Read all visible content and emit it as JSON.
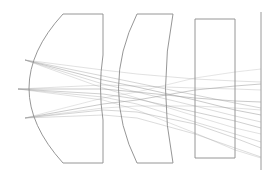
{
  "diagram": {
    "type": "optical-lens-ray-trace",
    "background": "#ffffff",
    "stroke_color": "#8a8a8a",
    "ray_color": "#9c9c9c",
    "elements": [
      {
        "name": "lens-1",
        "kind": "plano-convex",
        "path": "M63,14 L103,14 L103,55 Q98,88 103,120 L103,163 L63,163 Q-5,88 63,14 Z"
      },
      {
        "name": "lens-2",
        "kind": "meniscus",
        "path": "M137,14 L173,14 Q158,88 173,163 L137,163 Q100,88 137,14 Z"
      },
      {
        "name": "lens-3",
        "kind": "plate",
        "path": "M195,19 L235,19 L235,158 L195,158 Z"
      },
      {
        "name": "image-plane",
        "kind": "plane",
        "path": "M261,12 L261,170"
      }
    ],
    "rays": [
      {
        "d": "M25,60 L103,80 L137,87 L195,100 L235,110 L261,115",
        "opacity": 0.9
      },
      {
        "d": "M25,60 L103,76 L137,83 L195,95 L235,103 L261,108",
        "opacity": 0.7
      },
      {
        "d": "M25,60 L103,84 L137,92 L195,106 L235,116 L261,122",
        "opacity": 0.6
      },
      {
        "d": "M25,60 L103,70 L137,74 L195,79 L235,81 L261,82",
        "opacity": 0.5
      },
      {
        "d": "M25,60 L103,88 L137,98 L195,116 L235,128 L261,134",
        "opacity": 0.5
      },
      {
        "d": "M18,89 L103,89 L137,92 L195,98 L235,101 L261,102",
        "opacity": 0.9
      },
      {
        "d": "M18,89 L103,94 L137,99 L195,112 L235,121 L261,128",
        "opacity": 0.8
      },
      {
        "d": "M18,89 L103,97 L137,104 L195,122 L235,134 L261,142",
        "opacity": 0.6
      },
      {
        "d": "M18,89 L103,85 L137,86 L195,88 L235,89 L261,90",
        "opacity": 0.5
      },
      {
        "d": "M18,89 L103,100 L137,110 L195,133 L235,150 L261,158",
        "opacity": 0.5
      },
      {
        "d": "M25,118 L103,104 L137,100 L195,90 L235,86 L261,84",
        "opacity": 0.9
      },
      {
        "d": "M25,118 L103,110 L137,112 L195,124 L235,138 L261,148",
        "opacity": 0.7
      },
      {
        "d": "M25,118 L103,115 L137,118 L195,134 L235,148 L261,157",
        "opacity": 0.6
      },
      {
        "d": "M25,118 L103,108 L137,106 L195,106 L235,108 L261,110",
        "opacity": 0.5
      },
      {
        "d": "M25,118 L103,98 L137,92 L195,78 L235,72 L261,69",
        "opacity": 0.45
      }
    ]
  }
}
